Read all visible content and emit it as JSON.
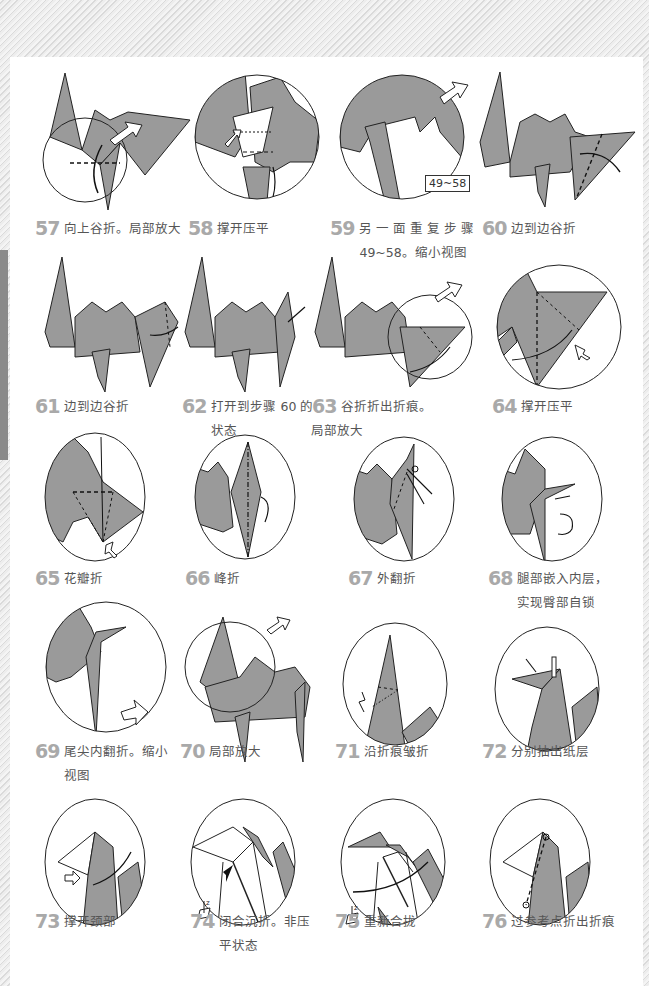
{
  "page": {
    "background_color": "#ffffff",
    "paper_color": "#9a9a9a",
    "number_color": "#a9a9a9",
    "text_color": "#555555"
  },
  "steps": [
    {
      "number": "57",
      "text": "向上谷折。局部放大",
      "text2": ""
    },
    {
      "number": "58",
      "text": "撑开压平",
      "text2": ""
    },
    {
      "number": "59",
      "text": "另 一 面 重 复 步 骤",
      "text2": "49~58。缩小视图"
    },
    {
      "number": "60",
      "text": "边到边谷折",
      "text2": ""
    },
    {
      "number": "61",
      "text": "边到边谷折",
      "text2": ""
    },
    {
      "number": "62",
      "text": "打开到步骤 60 的",
      "text2": "状态"
    },
    {
      "number": "63",
      "text": "谷折折出折痕。",
      "text2": "局部放大"
    },
    {
      "number": "64",
      "text": "撑开压平",
      "text2": ""
    },
    {
      "number": "65",
      "text": "花瓣折",
      "text2": ""
    },
    {
      "number": "66",
      "text": "峰折",
      "text2": ""
    },
    {
      "number": "67",
      "text": "外翻折",
      "text2": ""
    },
    {
      "number": "68",
      "text": "腿部嵌入内层，",
      "text2": "实现臀部自锁"
    },
    {
      "number": "69",
      "text": "尾尖内翻折。缩小",
      "text2": "视图"
    },
    {
      "number": "70",
      "text": "局部放大",
      "text2": ""
    },
    {
      "number": "71",
      "text": "沿折痕皱折",
      "text2": ""
    },
    {
      "number": "72",
      "text": "分别抽出纸层",
      "text2": ""
    },
    {
      "number": "73",
      "text": "撑开颈部",
      "text2": ""
    },
    {
      "number": "74",
      "text": "闭合沉折。非压",
      "text2": "平状态"
    },
    {
      "number": "75",
      "text": "重新合拢",
      "text2": ""
    },
    {
      "number": "76",
      "text": "过参考点折出折痕",
      "text2": ""
    }
  ],
  "annotations": {
    "step59_reference": "49~58",
    "z_axis_label": "z"
  },
  "icons": {
    "hollow_arrow": "hollow-push-arrow-icon",
    "fold_arrow": "curved-fold-arrow-icon",
    "turn_over": "turn-over-arrow-icon",
    "rotate": "rotate-arrow-icon",
    "z_axis": "z-axis-icon"
  }
}
